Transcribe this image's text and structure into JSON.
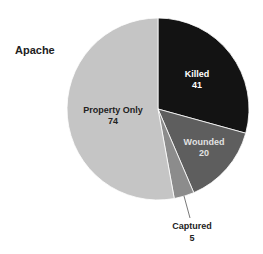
{
  "chart_data": {
    "type": "pie",
    "title": "Apache",
    "categories": [
      "Killed",
      "Wounded",
      "Captured",
      "Property Only"
    ],
    "values": [
      41,
      20,
      5,
      74
    ],
    "total": 140,
    "start_angle": "12 o'clock, clockwise",
    "colors": [
      "#131313",
      "#5e5e5e",
      "#8c8c8c",
      "#c5c5c5"
    ],
    "label_colors": [
      "#ffffff",
      "#e2e2e2",
      "#222222",
      "#222222"
    ],
    "legend": "none (labels on slices)",
    "annotations": [
      {
        "label": "Captured",
        "value": 5,
        "placement": "outside with leader line"
      }
    ]
  },
  "labels": {
    "title": "Apache",
    "killed": {
      "name": "Killed",
      "value": "41"
    },
    "wounded": {
      "name": "Wounded",
      "value": "20"
    },
    "captured": {
      "name": "Captured",
      "value": "5"
    },
    "property": {
      "name": "Property Only",
      "value": "74"
    }
  }
}
